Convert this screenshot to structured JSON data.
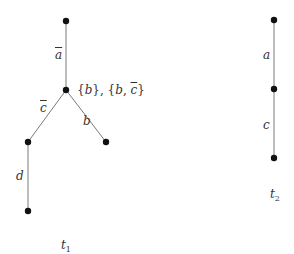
{
  "diagram": {
    "title": "",
    "colors": {
      "edge": "#7a7a7a",
      "node": "#111111",
      "label": "#333333"
    },
    "trees": [
      {
        "name": "t",
        "subscript": "1",
        "nodes": [
          {
            "id": "n0",
            "x": 66,
            "y": 21
          },
          {
            "id": "n1",
            "x": 66,
            "y": 90,
            "label": "{b}, {b, c̄}"
          },
          {
            "id": "n2",
            "x": 28,
            "y": 142
          },
          {
            "id": "n3",
            "x": 106,
            "y": 142
          },
          {
            "id": "n4",
            "x": 28,
            "y": 211
          }
        ],
        "edges": [
          {
            "from": "n0",
            "to": "n1",
            "label": "a",
            "negated": true
          },
          {
            "from": "n1",
            "to": "n2",
            "label": "c",
            "negated": true
          },
          {
            "from": "n1",
            "to": "n3",
            "label": "b",
            "negated": false
          },
          {
            "from": "n2",
            "to": "n4",
            "label": "d",
            "negated": false
          }
        ]
      },
      {
        "name": "t",
        "subscript": "2",
        "nodes": [
          {
            "id": "m0",
            "x": 274,
            "y": 20
          },
          {
            "id": "m1",
            "x": 274,
            "y": 89
          },
          {
            "id": "m2",
            "x": 274,
            "y": 158
          }
        ],
        "edges": [
          {
            "from": "m0",
            "to": "m1",
            "label": "a",
            "negated": false
          },
          {
            "from": "m1",
            "to": "m2",
            "label": "c",
            "negated": false
          }
        ]
      }
    ],
    "node_label_parts": {
      "open1": "{",
      "b1": "b",
      "close1": "}, {",
      "b2": "b",
      "comma": ", ",
      "c": "c",
      "close2": "}"
    }
  }
}
